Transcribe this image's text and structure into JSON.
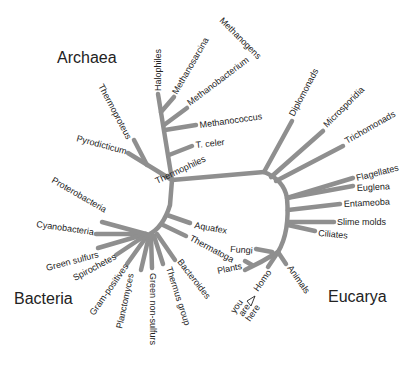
{
  "diagram": {
    "type": "phylogenetic-tree",
    "domains": {
      "archaea": "Archaea",
      "bacteria": "Bacteria",
      "eucarya": "Eucarya"
    },
    "colors": {
      "branch": "#8f8f8f",
      "text": "#222222",
      "background": "#ffffff"
    },
    "archaea": {
      "halophiles": "Halophiles",
      "methanosarcina": "Methanosarcina",
      "methanogens": "Methanogens",
      "methanobacterium": "Methanobacterium",
      "methanococcus": "Methanococcus",
      "t_celer": "T. celer",
      "thermoproteus": "Thermoproteus",
      "pyrodicticum": "Pyrodicticum",
      "thermophiles": "Thermophiles"
    },
    "bacteria": {
      "proteobacteria": "Proterobacteria",
      "cyanobacteria": "Cyanobacteria",
      "green_sulfurs": "Green sulfurs",
      "spirochetes": "Spirochetes",
      "gram_positives": "Gram-positives",
      "planctomyces": "Planctomyces",
      "green_non_sulfurs": "Green non-sulfurs",
      "thermus_group": "Thermus group",
      "bacteroides": "Bacteroides",
      "thermatoga": "Thermatoga",
      "aquafex": "Aquafex"
    },
    "eucarya": {
      "diplomonads": "Diplomonads",
      "microsporidia": "Microsporidia",
      "trichomonads": "Trichomonads",
      "flagellates": "Flagellates",
      "euglena": "Euglena",
      "entameoba": "Entameoba",
      "slime_molds": "Slime molds",
      "ciliates": "Ciliates",
      "fungi": "Fungi",
      "plants": "Plants",
      "homo": "Homo",
      "animals": "Animals",
      "you": "you",
      "are": "are",
      "here": "here"
    }
  }
}
